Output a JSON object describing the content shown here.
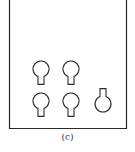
{
  "figure": {
    "caption": "(c)",
    "stroke_color": "#2a2a2a",
    "frame": {
      "left": 9,
      "right": 126,
      "top": 0,
      "bottom": 128,
      "open_top": true
    },
    "shapes": [
      {
        "name": "bulb-top-left",
        "cx": 41,
        "cy": 69,
        "r": 8,
        "stem": "down"
      },
      {
        "name": "bulb-top-middle",
        "cx": 71,
        "cy": 69,
        "r": 8,
        "stem": "down"
      },
      {
        "name": "bulb-bottom-left",
        "cx": 41,
        "cy": 101,
        "r": 8,
        "stem": "down"
      },
      {
        "name": "bulb-bottom-middle",
        "cx": 71,
        "cy": 101,
        "r": 8,
        "stem": "down"
      },
      {
        "name": "bulb-right-inverted",
        "cx": 103,
        "cy": 104,
        "r": 8,
        "stem": "up"
      }
    ]
  }
}
